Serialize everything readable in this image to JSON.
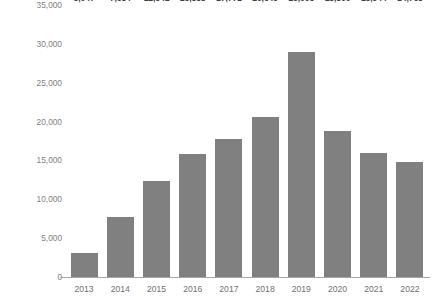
{
  "chart_data": {
    "type": "bar",
    "title": "",
    "subtitle": "",
    "xlabel": "",
    "ylabel": "Tons of garments collected",
    "categories": [
      "2013",
      "2014",
      "2015",
      "2016",
      "2017",
      "2018",
      "2019",
      "2020",
      "2021",
      "2022"
    ],
    "values": [
      3047,
      7684,
      12341,
      15888,
      17771,
      20649,
      29005,
      18800,
      15944,
      14768
    ],
    "value_labels": [
      "3,047",
      "7,684",
      "12,341",
      "15,888",
      "17,771",
      "20,649",
      "29,005",
      "18,800",
      "15,944",
      "14,768"
    ],
    "ylim": [
      0,
      35000
    ],
    "ytick_values": [
      0,
      5000,
      10000,
      15000,
      20000,
      25000,
      30000,
      35000
    ],
    "ytick_labels": [
      "0",
      "5,000",
      "10,000",
      "15,000",
      "20,000",
      "25,000",
      "30,000",
      "35,000"
    ],
    "grid": false,
    "legend": false,
    "legend_position": "none",
    "series": [
      {
        "name": "Tons of garments collected",
        "values": [
          3047,
          7684,
          12341,
          15888,
          17771,
          20649,
          29005,
          18800,
          15944,
          14768
        ]
      }
    ]
  },
  "colors": {
    "bar_fill": "#808080",
    "axis_line": "#a6a6a6",
    "tick_text": "#808080",
    "value_text": "#3f3f3f",
    "background": "#ffffff"
  }
}
